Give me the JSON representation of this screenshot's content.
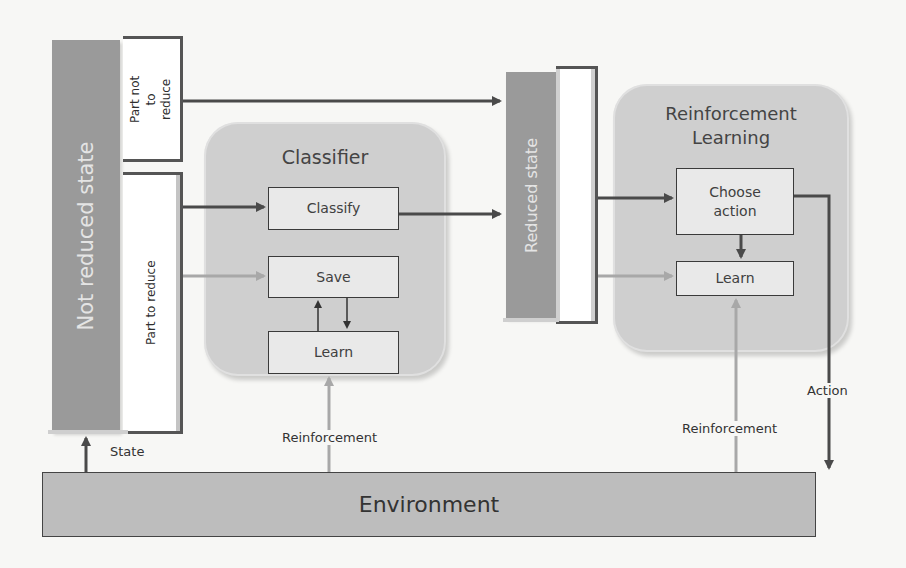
{
  "diagram": {
    "state_bar": {
      "label": "Not reduced state"
    },
    "part_not_to_reduce": {
      "label": "Part not to reduce"
    },
    "part_to_reduce": {
      "label": "Part to reduce"
    },
    "classifier": {
      "title": "Classifier",
      "boxes": {
        "classify": "Classify",
        "save": "Save",
        "learn": "Learn"
      }
    },
    "reduced_state": {
      "label": "Reduced state"
    },
    "rl": {
      "title_line1": "Reinforcement",
      "title_line2": "Learning",
      "boxes": {
        "choose_action_line1": "Choose",
        "choose_action_line2": "action",
        "learn": "Learn"
      }
    },
    "environment": {
      "label": "Environment"
    },
    "edge_labels": {
      "state": "State",
      "reinforcement_left": "Reinforcement",
      "reinforcement_right": "Reinforcement",
      "action": "Action"
    },
    "colors": {
      "dark_arrow": "#4a4a4a",
      "light_arrow": "#a8a8a8",
      "panel": "#cfcfcf",
      "state_bar": "#9a9a9a",
      "environment": "#bdbdbd"
    }
  }
}
